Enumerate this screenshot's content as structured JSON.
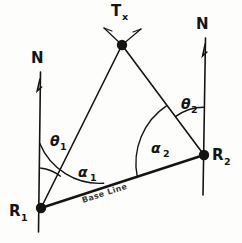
{
  "diagram": {
    "background_color": "#fdfdfb",
    "ink_color": "#141414",
    "nodes": [
      {
        "id": "tx",
        "label": "T",
        "subscript": "x",
        "x": 122,
        "y": 45,
        "name": "transmitter"
      },
      {
        "id": "r1",
        "label": "R",
        "subscript": "1",
        "x": 41,
        "y": 208,
        "name": "receiver-one"
      },
      {
        "id": "r2",
        "label": "R",
        "subscript": "2",
        "x": 204,
        "y": 155,
        "name": "receiver-two"
      }
    ],
    "north_markers": [
      {
        "id": "north-left",
        "label": "N",
        "x": 38,
        "y": 57
      },
      {
        "id": "north-right",
        "label": "N",
        "x": 203,
        "y": 23
      }
    ],
    "angles": [
      {
        "id": "theta1",
        "label": "θ",
        "subscript": "1",
        "x": 57,
        "y": 140,
        "at": "r1",
        "between": "north-left / tx"
      },
      {
        "id": "alpha1",
        "label": "α",
        "subscript": "1",
        "x": 87,
        "y": 172,
        "at": "r1",
        "between": "north-left / base-line"
      },
      {
        "id": "theta2",
        "label": "θ",
        "subscript": "2",
        "x": 189,
        "y": 103,
        "at": "r2",
        "between": "tx / north-right"
      },
      {
        "id": "alpha2",
        "label": "α",
        "subscript": "2",
        "x": 160,
        "y": 148,
        "at": "r2",
        "between": "base-line / tx"
      }
    ],
    "edges": [
      {
        "id": "tx-r1",
        "from": "tx",
        "to": "r1",
        "name": "bearing-line-one"
      },
      {
        "id": "tx-r2",
        "from": "tx",
        "to": "r2",
        "name": "bearing-line-two"
      },
      {
        "id": "base",
        "from": "r1",
        "to": "r2",
        "name": "base-line"
      }
    ],
    "base_line_label": "Base Line"
  }
}
